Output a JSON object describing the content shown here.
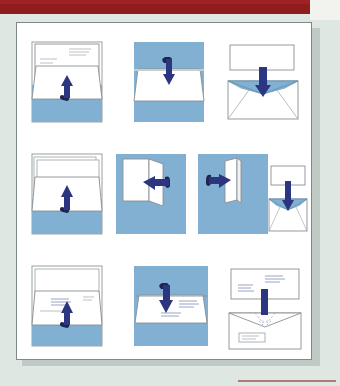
{
  "document": {
    "type": "instructional-diagram",
    "subject": "How to fold a letter and insert it into an envelope",
    "panel_count": 10,
    "rows": 3
  },
  "colors": {
    "paper_blue": "#82b0d2",
    "arrow_navy": "#2b3580",
    "arrow_navy_dark": "#222a63",
    "sheet_white": "#ffffff",
    "outline_gray": "#8b8f92",
    "page_background": "#dfe7e2",
    "top_band_red": "#8f1d1d",
    "figure_border": "#7e8a86",
    "text_line_gray": "#b9bcc2"
  },
  "panels": [
    {
      "index": 1,
      "row": 1,
      "name": "fold-letter-bottom-up",
      "caption": "Letter with text, bottom third folded upward",
      "arrow": "up",
      "background": "#82b0d2",
      "has_text_lines": true
    },
    {
      "index": 2,
      "row": 1,
      "name": "fold-letter-top-down",
      "caption": "Top third of the letter folded downward",
      "arrow": "down",
      "background": "#82b0d2",
      "has_text_lines": false
    },
    {
      "index": 3,
      "row": 1,
      "name": "insert-letter-into-envelope",
      "caption": "Folded letter inserted into open envelope",
      "arrow": "down",
      "background": "#ffffff",
      "has_text_lines": false
    },
    {
      "index": 4,
      "row": 2,
      "name": "fold-stack-bottom-up",
      "caption": "Stack of sheets folded upward",
      "arrow": "up",
      "background": "#82b0d2",
      "has_text_lines": false
    },
    {
      "index": 5,
      "row": 2,
      "name": "fold-sheet-right-to-left",
      "caption": "Sheet folded from right to left",
      "arrow": "left",
      "background": "#82b0d2",
      "has_text_lines": false
    },
    {
      "index": 6,
      "row": 2,
      "name": "fold-sheet-left-to-right",
      "caption": "Sheet folded from left to right",
      "arrow": "right",
      "background": "#82b0d2",
      "has_text_lines": false
    },
    {
      "index": 7,
      "row": 2,
      "name": "insert-folded-sheet-into-envelope",
      "caption": "Folded sheet inserted into open envelope",
      "arrow": "down",
      "background": "#ffffff",
      "has_text_lines": false
    },
    {
      "index": 8,
      "row": 3,
      "name": "fold-addressed-letter-up",
      "caption": "Addressed letter folded upward showing address block",
      "arrow": "up",
      "background": "#82b0d2",
      "has_text_lines": true
    },
    {
      "index": 9,
      "row": 3,
      "name": "fold-addressed-letter-down",
      "caption": "Addressed letter folded downward, address visible",
      "arrow": "down",
      "background": "#82b0d2",
      "has_text_lines": true
    },
    {
      "index": 10,
      "row": 3,
      "name": "insert-into-window-envelope",
      "caption": "Letter inserted into window envelope, address aligns with window",
      "arrow": "down",
      "background": "#ffffff",
      "has_text_lines": true
    }
  ]
}
